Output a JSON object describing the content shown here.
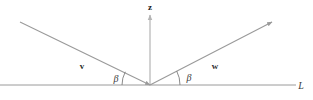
{
  "figure": {
    "canvas": {
      "width": 313,
      "height": 100,
      "background": "#ffffff"
    },
    "colors": {
      "baseline": "#9a9a9a",
      "vector": "#9a9a9a",
      "axis": "#b4b4b4",
      "arc": "#7d7d7d",
      "label_dark": "#2b2b2b",
      "label_gray": "#3a3a3a"
    },
    "origin": {
      "x": 150,
      "y": 85
    },
    "baseline": {
      "name": "horizontal-line-L",
      "label": "L",
      "x1": 0,
      "y1": 85,
      "x2": 296,
      "y2": 85,
      "label_x": 301,
      "label_y": 89
    },
    "axis_z": {
      "name": "z-axis",
      "label": "z",
      "x1": 150,
      "y1": 85,
      "x2": 150,
      "y2": 15,
      "label_x": 150,
      "label_y": 10,
      "arrowhead": true
    },
    "vectors": [
      {
        "name": "vector-v",
        "label": "v",
        "x1": 20,
        "y1": 22,
        "x2": 150,
        "y2": 85,
        "label_x": 82,
        "label_y": 69,
        "arrowhead": "end",
        "angle_deg": 26
      },
      {
        "name": "vector-w",
        "label": "w",
        "x1": 150,
        "y1": 85,
        "x2": 272,
        "y2": 22,
        "label_x": 215,
        "label_y": 69,
        "arrowhead": "end",
        "angle_deg": 27
      }
    ],
    "angles": [
      {
        "name": "angle-beta-left",
        "label": "β",
        "label_x": 116,
        "label_y": 82,
        "arc_radius": 28,
        "side": "left"
      },
      {
        "name": "angle-beta-right",
        "label": "β",
        "label_x": 183,
        "label_y": 81,
        "arc_radius": 30,
        "side": "right"
      }
    ]
  }
}
